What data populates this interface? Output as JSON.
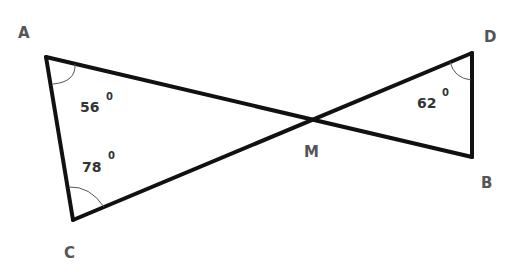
{
  "diagram": {
    "type": "geometry-figure",
    "points": {
      "A": {
        "label": "A",
        "x": 46,
        "y": 57,
        "label_x": 18,
        "label_y": 38
      },
      "B": {
        "label": "B",
        "x": 472,
        "y": 157,
        "label_x": 481,
        "label_y": 188
      },
      "C": {
        "label": "C",
        "x": 73,
        "y": 220,
        "label_x": 64,
        "label_y": 258
      },
      "D": {
        "label": "D",
        "x": 472,
        "y": 53,
        "label_x": 484,
        "label_y": 42
      },
      "M": {
        "label": "M",
        "x": 307,
        "y": 123,
        "label_x": 304,
        "label_y": 157
      }
    },
    "segments": [
      {
        "from": "A",
        "to": "B"
      },
      {
        "from": "C",
        "to": "D"
      },
      {
        "from": "A",
        "to": "C"
      },
      {
        "from": "D",
        "to": "B"
      }
    ],
    "angles": [
      {
        "vertex": "A",
        "value": "56",
        "unit": "0",
        "label_x": 80,
        "label_y": 112,
        "deg_x": 105,
        "deg_y": 98
      },
      {
        "vertex": "C",
        "value": "78",
        "unit": "0",
        "label_x": 82,
        "label_y": 172,
        "deg_x": 108,
        "deg_y": 157
      },
      {
        "vertex": "D",
        "value": "62",
        "unit": "0",
        "label_x": 417,
        "label_y": 108,
        "deg_x": 441,
        "deg_y": 94
      }
    ]
  }
}
